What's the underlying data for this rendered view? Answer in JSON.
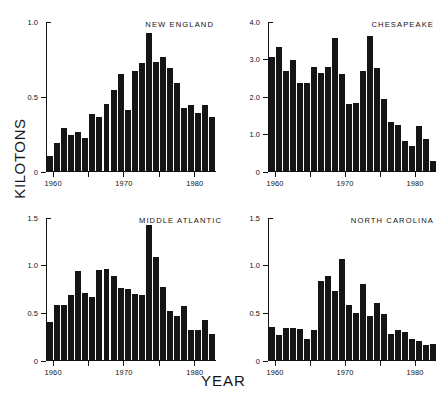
{
  "figure": {
    "ylabel": "KILOTONS",
    "xlabel": "YEAR"
  },
  "chart_data": [
    {
      "type": "bar",
      "title": "NEW ENGLAND",
      "xlabel": "YEAR",
      "ylabel": "KILOTONS",
      "ylim": [
        0,
        1.0
      ],
      "yticks": [
        0,
        0.5,
        1.0
      ],
      "ytick_labels": [
        "0",
        "0.5",
        "1.0"
      ],
      "xlim": [
        1959.5,
        1983.5
      ],
      "xticks": [
        1960,
        1965,
        1970,
        1975,
        1980
      ],
      "xtick_labels": [
        "1960",
        "",
        "1970",
        "",
        "1980"
      ],
      "grid": false,
      "legend": "none",
      "categories": [
        1960,
        1961,
        1962,
        1963,
        1964,
        1965,
        1966,
        1967,
        1968,
        1969,
        1970,
        1971,
        1972,
        1973,
        1974,
        1975,
        1976,
        1977,
        1978,
        1979,
        1980,
        1981,
        1982,
        1983
      ],
      "values": [
        0.1,
        0.19,
        0.29,
        0.24,
        0.26,
        0.22,
        0.38,
        0.36,
        0.45,
        0.54,
        0.65,
        0.41,
        0.67,
        0.72,
        0.92,
        0.73,
        0.76,
        0.69,
        0.59,
        0.42,
        0.44,
        0.39,
        0.44,
        0.36
      ]
    },
    {
      "type": "bar",
      "title": "CHESAPEAKE",
      "xlabel": "YEAR",
      "ylabel": "KILOTONS",
      "ylim": [
        0,
        4.0
      ],
      "yticks": [
        0,
        1.0,
        2.0,
        3.0,
        4.0
      ],
      "ytick_labels": [
        "0",
        "1.0",
        "2.0",
        "3.0",
        "4.0"
      ],
      "xlim": [
        1959.5,
        1983.5
      ],
      "xticks": [
        1960,
        1965,
        1970,
        1975,
        1980
      ],
      "xtick_labels": [
        "1960",
        "",
        "1970",
        "",
        "1980"
      ],
      "grid": false,
      "legend": "none",
      "categories": [
        1960,
        1961,
        1962,
        1963,
        1964,
        1965,
        1966,
        1967,
        1968,
        1969,
        1970,
        1971,
        1972,
        1973,
        1974,
        1975,
        1976,
        1977,
        1978,
        1979,
        1980,
        1981,
        1982,
        1983
      ],
      "values": [
        3.05,
        3.3,
        2.68,
        2.95,
        2.35,
        2.35,
        2.78,
        2.62,
        2.78,
        3.55,
        2.6,
        1.8,
        1.82,
        2.68,
        3.6,
        2.75,
        1.92,
        1.3,
        1.22,
        0.8,
        0.67,
        1.2,
        0.86,
        0.27
      ]
    },
    {
      "type": "bar",
      "title": "MIDDLE ATLANTIC",
      "xlabel": "YEAR",
      "ylabel": "KILOTONS",
      "ylim": [
        0,
        1.5
      ],
      "yticks": [
        0,
        0.5,
        1.0,
        1.5
      ],
      "ytick_labels": [
        "0",
        "0.5",
        "1.0",
        "1.5"
      ],
      "xlim": [
        1959.5,
        1983.5
      ],
      "xticks": [
        1960,
        1965,
        1970,
        1975,
        1980
      ],
      "xtick_labels": [
        "1960",
        "",
        "1970",
        "",
        "1980"
      ],
      "grid": false,
      "legend": "none",
      "categories": [
        1960,
        1961,
        1962,
        1963,
        1964,
        1965,
        1966,
        1967,
        1968,
        1969,
        1970,
        1971,
        1972,
        1973,
        1974,
        1975,
        1976,
        1977,
        1978,
        1979,
        1980,
        1981,
        1982,
        1983
      ],
      "values": [
        0.4,
        0.58,
        0.58,
        0.68,
        0.93,
        0.7,
        0.66,
        0.94,
        0.95,
        0.88,
        0.76,
        0.74,
        0.69,
        0.68,
        1.42,
        1.08,
        0.77,
        0.51,
        0.46,
        0.57,
        0.32,
        0.31,
        0.42,
        0.27
      ]
    },
    {
      "type": "bar",
      "title": "NORTH CAROLINA",
      "xlabel": "YEAR",
      "ylabel": "KILOTONS",
      "ylim": [
        0,
        1.5
      ],
      "yticks": [
        0,
        0.5,
        1.0,
        1.5
      ],
      "ytick_labels": [
        "0",
        "0.5",
        "1.0",
        "1.5"
      ],
      "xlim": [
        1959.5,
        1983.5
      ],
      "xticks": [
        1960,
        1965,
        1970,
        1975,
        1980
      ],
      "xtick_labels": [
        "1960",
        "",
        "1970",
        "",
        "1980"
      ],
      "grid": false,
      "legend": "none",
      "categories": [
        1960,
        1961,
        1962,
        1963,
        1964,
        1965,
        1966,
        1967,
        1968,
        1969,
        1970,
        1971,
        1972,
        1973,
        1974,
        1975,
        1976,
        1977,
        1978,
        1979,
        1980,
        1981,
        1982,
        1983
      ],
      "values": [
        0.35,
        0.26,
        0.34,
        0.34,
        0.33,
        0.22,
        0.31,
        0.83,
        0.88,
        0.72,
        1.06,
        0.58,
        0.49,
        0.8,
        0.46,
        0.6,
        0.48,
        0.27,
        0.32,
        0.29,
        0.22,
        0.2,
        0.16,
        0.17
      ]
    }
  ],
  "panel_layout": [
    {
      "left": 46,
      "top": 22,
      "width": 170,
      "height": 150
    },
    {
      "left": 268,
      "top": 22,
      "width": 168,
      "height": 150
    },
    {
      "left": 46,
      "top": 218,
      "width": 170,
      "height": 143
    },
    {
      "left": 268,
      "top": 218,
      "width": 168,
      "height": 143
    }
  ]
}
